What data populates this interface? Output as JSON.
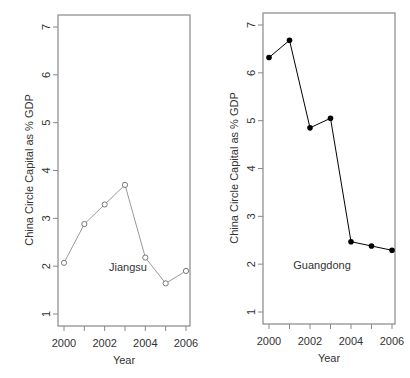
{
  "chart_data": [
    {
      "type": "line",
      "title": "",
      "annotation": "Jiangsu",
      "xlabel": "Year",
      "ylabel": "China Circle Capital as % GDP",
      "x": [
        2000,
        2001,
        2002,
        2003,
        2004,
        2005,
        2006
      ],
      "series": [
        {
          "name": "Jiangsu",
          "values": [
            2.07,
            2.88,
            3.29,
            3.7,
            2.18,
            1.64,
            1.9
          ],
          "marker": "open-circle",
          "color": "#999999"
        }
      ],
      "xticks": [
        "2000",
        "2002",
        "2004",
        "2006"
      ],
      "yticks": [
        "1",
        "2",
        "3",
        "4",
        "5",
        "6",
        "7"
      ],
      "ylim": [
        1,
        7
      ],
      "xlim": [
        2000,
        2006
      ],
      "grid": false
    },
    {
      "type": "line",
      "title": "",
      "annotation": "Guangdong",
      "xlabel": "Year",
      "ylabel": "China Circle Capital as % GDP",
      "x": [
        2000,
        2001,
        2002,
        2003,
        2004,
        2005,
        2006
      ],
      "series": [
        {
          "name": "Guangdong",
          "values": [
            6.32,
            6.68,
            4.85,
            5.05,
            2.47,
            2.38,
            2.29
          ],
          "marker": "filled-circle",
          "color": "#000000"
        }
      ],
      "xticks": [
        "2000",
        "2002",
        "2004",
        "2006"
      ],
      "yticks": [
        "1",
        "2",
        "3",
        "4",
        "5",
        "6",
        "7"
      ],
      "ylim": [
        1,
        7
      ],
      "xlim": [
        2000,
        2006
      ],
      "grid": false
    }
  ]
}
